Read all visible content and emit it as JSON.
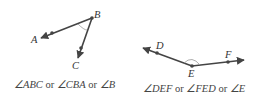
{
  "figures": [
    {
      "id": "left",
      "points": {
        "A": "A",
        "B": "B",
        "C": "C"
      },
      "caption": {
        "p1": "∠ABC",
        "or1": " or ",
        "p2": "∠CBA",
        "or2": " or ",
        "p3": "∠B"
      }
    },
    {
      "id": "right",
      "points": {
        "D": "D",
        "E": "E",
        "F": "F"
      },
      "caption": {
        "p1": "∠DEF",
        "or1": " or ",
        "p2": "∠FED",
        "or2": " or ",
        "p3": "∠E"
      }
    }
  ],
  "colors": {
    "ray": "#444444",
    "arc": "#999999"
  }
}
